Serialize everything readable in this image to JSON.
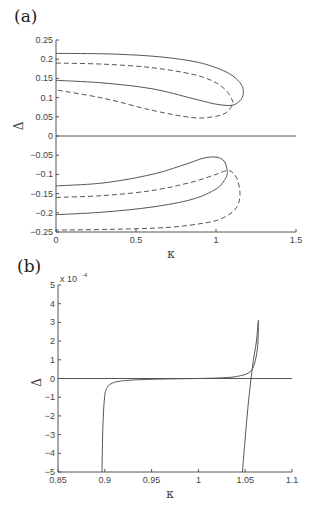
{
  "panels": {
    "a": {
      "label": "(a)"
    },
    "b": {
      "label": "(b)",
      "exponent": "x 10",
      "exponent_power": "-4"
    }
  },
  "chart_data": [
    {
      "type": "line",
      "panel": "(a)",
      "xlabel": "κ",
      "ylabel": "Δ",
      "xlim": [
        0,
        1.5
      ],
      "ylim": [
        -0.25,
        0.25
      ],
      "xticks": [
        0,
        0.5,
        1,
        1.5
      ],
      "xtick_labels": [
        "0",
        "0.5",
        "1",
        "1.5"
      ],
      "yticks": [
        0.25,
        0.2,
        0.15,
        0.1,
        0.05,
        0,
        -0.05,
        -0.1,
        -0.15,
        -0.2,
        -0.25
      ],
      "ytick_labels": [
        "0.25",
        "0.2",
        "0.15",
        "0.1",
        "0.05",
        "0",
        "-0.05",
        "-0.1",
        "-0.15",
        "-0.2",
        "-0.25"
      ],
      "grid": false,
      "series": [
        {
          "name": "upper solid",
          "style": "solid",
          "x": [
            0,
            0.3,
            0.6,
            0.85,
            1.0,
            1.1,
            1.16,
            1.17,
            1.15,
            1.1,
            1.0,
            0.85,
            0.6,
            0.3,
            0
          ],
          "y": [
            0.215,
            0.214,
            0.208,
            0.195,
            0.178,
            0.158,
            0.133,
            0.11,
            0.092,
            0.08,
            0.083,
            0.098,
            0.123,
            0.138,
            0.145
          ]
        },
        {
          "name": "upper dashed",
          "style": "dashed",
          "x": [
            0,
            0.3,
            0.6,
            0.85,
            0.98,
            1.06,
            1.1,
            1.1,
            1.06,
            0.98,
            0.85,
            0.6,
            0.3,
            0
          ],
          "y": [
            0.19,
            0.187,
            0.178,
            0.161,
            0.143,
            0.12,
            0.095,
            0.08,
            0.06,
            0.05,
            0.048,
            0.067,
            0.098,
            0.12
          ]
        },
        {
          "name": "zero line",
          "style": "solid",
          "x": [
            0,
            1.5
          ],
          "y": [
            0,
            0
          ]
        },
        {
          "name": "lower solid",
          "style": "solid",
          "x": [
            0,
            0.3,
            0.6,
            0.8,
            0.92,
            1.0,
            1.05,
            1.07,
            1.06,
            1.0,
            0.85,
            0.6,
            0.3,
            0
          ],
          "y": [
            -0.13,
            -0.122,
            -0.1,
            -0.075,
            -0.058,
            -0.055,
            -0.065,
            -0.09,
            -0.11,
            -0.138,
            -0.165,
            -0.185,
            -0.198,
            -0.205
          ]
        },
        {
          "name": "lower dashed",
          "style": "dashed",
          "x": [
            0,
            0.3,
            0.6,
            0.85,
            1.0,
            1.08,
            1.13,
            1.15,
            1.13,
            1.06,
            0.95,
            0.7,
            0.35,
            0
          ],
          "y": [
            -0.16,
            -0.155,
            -0.142,
            -0.12,
            -0.1,
            -0.09,
            -0.11,
            -0.15,
            -0.185,
            -0.21,
            -0.225,
            -0.238,
            -0.243,
            -0.245
          ]
        }
      ]
    },
    {
      "type": "line",
      "panel": "(b)",
      "xlabel": "κ",
      "ylabel": "Δ",
      "y_multiplier": "x 10^-4",
      "xlim": [
        0.85,
        1.1
      ],
      "ylim": [
        -5,
        5
      ],
      "xticks": [
        0.85,
        0.9,
        0.95,
        1,
        1.05,
        1.1
      ],
      "xtick_labels": [
        "0.85",
        "0.9",
        "0.95",
        "1",
        "1.05",
        "1.1"
      ],
      "yticks": [
        5,
        4,
        3,
        2,
        1,
        0,
        -1,
        -2,
        -3,
        -4,
        -5
      ],
      "ytick_labels": [
        "5",
        "4",
        "3",
        "2",
        "1",
        "0",
        "-1",
        "-2",
        "-3",
        "-4",
        "-5"
      ],
      "grid": false,
      "series": [
        {
          "name": "zero line",
          "style": "solid",
          "x": [
            0.85,
            1.1
          ],
          "y": [
            0,
            0
          ]
        },
        {
          "name": "curve",
          "style": "solid",
          "x": [
            0.897,
            0.898,
            0.9,
            0.903,
            0.908,
            0.915,
            0.93,
            0.96,
            1.0,
            1.03,
            1.045,
            1.055,
            1.06,
            1.063,
            1.064,
            1.064,
            1.062,
            1.058,
            1.053,
            1.047
          ],
          "y": [
            -5,
            -2.5,
            -0.9,
            -0.45,
            -0.25,
            -0.15,
            -0.08,
            -0.03,
            0.0,
            0.05,
            0.15,
            0.35,
            0.8,
            1.6,
            2.5,
            3.1,
            2.0,
            0.7,
            -1.5,
            -5
          ]
        }
      ]
    }
  ]
}
